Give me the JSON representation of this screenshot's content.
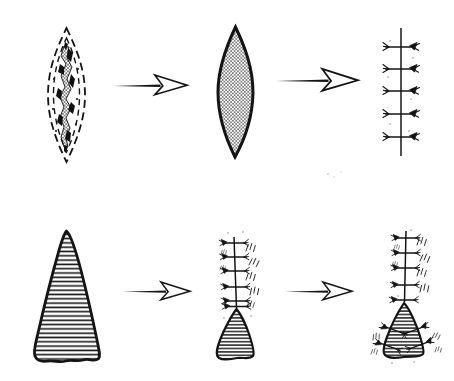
{
  "figure": {
    "background_color": "#ffffff",
    "ink_color": "#141414",
    "rows": [
      {
        "name": "elliptical-excision-sequence",
        "steps": [
          {
            "icon": "lesion-with-dashed-excision-outline-icon",
            "description": "irregular crosshatched scar inside double dashed elliptical excision marking"
          },
          {
            "icon": "arrow-right-icon"
          },
          {
            "icon": "hatched-elliptical-defect-icon",
            "description": "lens-shaped excised wound shaded with fine mesh crosshatch"
          },
          {
            "icon": "arrow-right-icon"
          },
          {
            "icon": "interrupted-suture-line-icon",
            "suture_count": 5,
            "description": "vertical closure line crossed by five interrupted sutures with knots"
          }
        ]
      },
      {
        "name": "triangular-defect-closure-sequence",
        "steps": [
          {
            "icon": "hatched-triangular-defect-icon",
            "description": "large teardrop-triangular wound shaded with horizontal hatching"
          },
          {
            "icon": "arrow-right-icon"
          },
          {
            "icon": "partially-sutured-defect-icon",
            "suture_count": 6,
            "description": "upper wound closed with knotted sutures, small hatched triangular defect remaining below"
          },
          {
            "icon": "arrow-right-icon"
          },
          {
            "icon": "fully-sutured-repair-icon",
            "suture_count": 10,
            "description": "sutured vertical line above a hatched triangular flap stitched along both slanted edges"
          }
        ]
      }
    ]
  }
}
